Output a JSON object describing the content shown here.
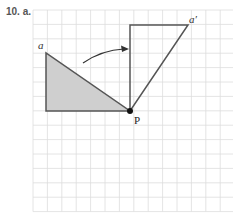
{
  "problem": {
    "number_label": "10. a."
  },
  "diagram": {
    "grid": {
      "x0": 33,
      "y0": 10,
      "cell": 14.4,
      "cols": 14,
      "rows": 14,
      "color": "#dddddd"
    },
    "original_triangle": {
      "label": "a",
      "vertices": [
        [
          46,
          53
        ],
        [
          46,
          111
        ],
        [
          130,
          111
        ]
      ],
      "fill": "#cfcfcf",
      "stroke": "#555555"
    },
    "image_triangle": {
      "label": "a′",
      "vertices": [
        [
          130,
          25
        ],
        [
          188,
          25
        ],
        [
          130,
          111
        ]
      ],
      "fill": "none",
      "stroke": "#555555"
    },
    "center": {
      "label": "P",
      "x": 130,
      "y": 111
    },
    "arrow": {
      "description": "curved rotation arrow",
      "from": [
        83,
        63
      ],
      "to": [
        128,
        49
      ]
    }
  }
}
